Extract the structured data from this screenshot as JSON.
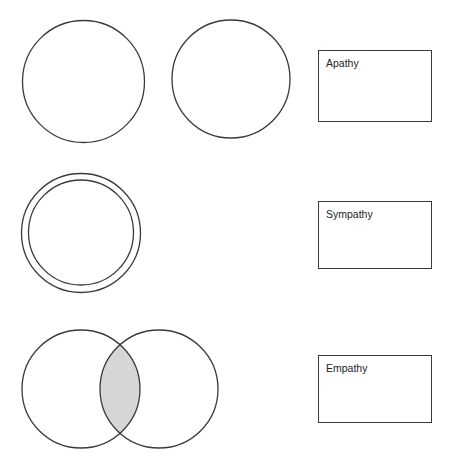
{
  "diagram": {
    "stroke_color": "#3a3a3a",
    "fill_color": "#ffffff",
    "shade_color": "#d6d6d6",
    "background_color": "#ffffff",
    "rows": [
      {
        "id": "apathy",
        "label": "Apathy",
        "relation": "separate",
        "shapes": [
          {
            "name": "circle-left",
            "cx": 83.5,
            "cy": 81.5,
            "r": 61.0
          },
          {
            "name": "circle-right",
            "cx": 231.0,
            "cy": 79.0,
            "r": 59.0
          }
        ],
        "box": {
          "x": 318,
          "y": 50,
          "width": 114,
          "height": 72
        }
      },
      {
        "id": "sympathy",
        "label": "Sympathy",
        "relation": "concentric",
        "shapes": [
          {
            "name": "circle-outer",
            "cx": 81.0,
            "cy": 233.0,
            "r": 59.5
          },
          {
            "name": "circle-inner",
            "cx": 81.0,
            "cy": 232.5,
            "r": 52.5
          }
        ],
        "box": {
          "x": 318,
          "y": 201,
          "width": 114,
          "height": 68
        }
      },
      {
        "id": "empathy",
        "label": "Empathy",
        "relation": "overlapping",
        "shapes": [
          {
            "name": "circle-left",
            "cx": 81.0,
            "cy": 389.0,
            "r": 59.0
          },
          {
            "name": "circle-right",
            "cx": 159.0,
            "cy": 389.0,
            "r": 59.0
          }
        ],
        "intersection": {
          "name": "lens-shaded-region",
          "shaded": true
        },
        "box": {
          "x": 318,
          "y": 355,
          "width": 114,
          "height": 68
        }
      }
    ]
  }
}
